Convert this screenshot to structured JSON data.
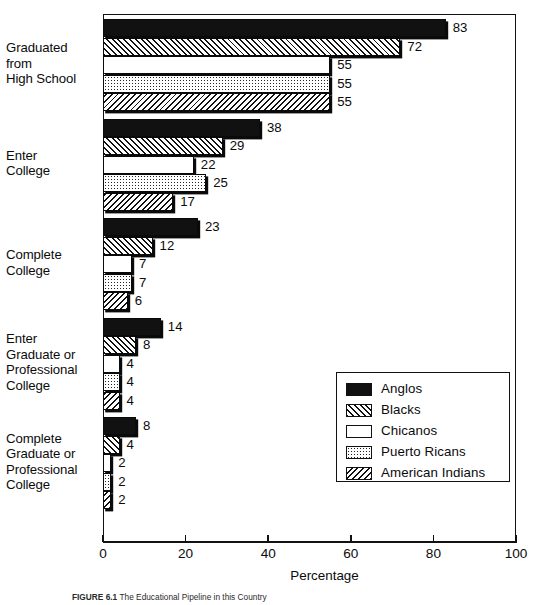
{
  "chart_data": {
    "type": "bar",
    "orientation": "horizontal",
    "title": "",
    "xlabel": "Percentage",
    "ylabel": "",
    "xlim": [
      0,
      100
    ],
    "xticks": [
      0,
      20,
      40,
      60,
      80,
      100
    ],
    "grid": false,
    "legend_position": "middle-right",
    "categories": [
      "Graduated from High School",
      "Enter College",
      "Complete College",
      "Enter Graduate or Professional College",
      "Complete Graduate or Professional College"
    ],
    "category_label_lines": [
      [
        "Graduated",
        "from",
        "High School"
      ],
      [
        "Enter",
        "College"
      ],
      [
        "Complete",
        "College"
      ],
      [
        "Enter",
        "Graduate or",
        "Professional",
        "College"
      ],
      [
        "Complete",
        "Graduate or",
        "Professional",
        "College"
      ]
    ],
    "series": [
      {
        "name": "Anglos",
        "pattern": "solid-black",
        "values": [
          83,
          38,
          23,
          14,
          8
        ]
      },
      {
        "name": "Blacks",
        "pattern": "diagonal-hatch-left",
        "values": [
          72,
          29,
          12,
          8,
          4
        ]
      },
      {
        "name": "Chicanos",
        "pattern": "white",
        "values": [
          55,
          22,
          7,
          4,
          2
        ]
      },
      {
        "name": "Puerto Ricans",
        "pattern": "dotted",
        "values": [
          55,
          25,
          7,
          4,
          2
        ]
      },
      {
        "name": "American Indians",
        "pattern": "diagonal-hatch-right",
        "values": [
          55,
          17,
          6,
          4,
          2
        ]
      }
    ]
  },
  "legend": {
    "items": [
      {
        "label": "Anglos",
        "pattern": "solid-black"
      },
      {
        "label": "Blacks",
        "pattern": "diagonal-hatch-left"
      },
      {
        "label": "Chicanos",
        "pattern": "white"
      },
      {
        "label": "Puerto Ricans",
        "pattern": "dotted"
      },
      {
        "label": "American Indians",
        "pattern": "diagonal-hatch-right"
      }
    ]
  },
  "axis": {
    "x_title": "Percentage",
    "x_tick_labels": [
      "0",
      "20",
      "40",
      "60",
      "80",
      "100"
    ]
  },
  "caption": {
    "figure_number": "FIGURE 6.1",
    "text": "The Educational Pipeline in this Country"
  }
}
